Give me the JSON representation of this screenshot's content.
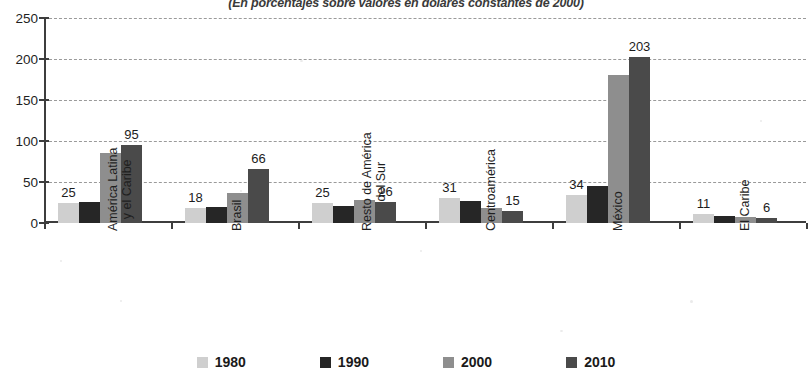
{
  "chart_data": {
    "type": "bar",
    "title": "(En porcentajes sobre valores en dólares constantes de 2000)",
    "xlabel": "",
    "ylabel": "",
    "ylim": [
      0,
      250
    ],
    "yticks": [
      0,
      50,
      100,
      150,
      200,
      250
    ],
    "grid": true,
    "legend_position": "bottom",
    "categories": [
      "América Latina y el Caribe",
      "Brasil",
      "Resto de América del Sur",
      "Centroamérica",
      "México",
      "El Caribe"
    ],
    "category_lines": [
      [
        "América Latina",
        "y el Caribe"
      ],
      [
        "Brasil"
      ],
      [
        "Resto de América",
        "del Sur"
      ],
      [
        "Centroamérica"
      ],
      [
        "México"
      ],
      [
        "El Caribe"
      ]
    ],
    "series": [
      {
        "name": "1980",
        "color": "#cfcfcf",
        "values": [
          25,
          18,
          25,
          31,
          34,
          11
        ]
      },
      {
        "name": "1990",
        "color": "#262626",
        "values": [
          26,
          20,
          21,
          27,
          45,
          9
        ]
      },
      {
        "name": "2000",
        "color": "#8e8e8e",
        "values": [
          85,
          36,
          28,
          18,
          180,
          7
        ]
      },
      {
        "name": "2010",
        "color": "#4a4a4a",
        "values": [
          95,
          66,
          26,
          15,
          203,
          6
        ]
      }
    ],
    "data_labels": {
      "1980": [
        "25",
        "18",
        "25",
        "31",
        "34",
        "11"
      ],
      "2010": [
        "95",
        "66",
        "26",
        "15",
        "203",
        "6"
      ]
    }
  }
}
